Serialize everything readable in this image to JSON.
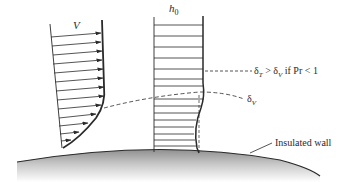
{
  "diagram": {
    "velocity_profile": {
      "label": "V",
      "arrow_count": 15
    },
    "enthalpy_profile": {
      "label_base": "h",
      "label_sub": "0",
      "line_count": 16
    },
    "annotations": {
      "thermal_layer": {
        "delta": "δ",
        "sub_t": "T",
        "mid": " > δ",
        "sub_v": "V",
        "tail": " if Pr < 1"
      },
      "velocity_layer": {
        "delta": "δ",
        "sub_v": "V"
      },
      "wall": "Insulated wall"
    },
    "colors": {
      "ink": "#2a2a2a",
      "wall_top": "#9a9a9a",
      "wall_bottom": "#ffffff",
      "background": "#ffffff"
    }
  }
}
